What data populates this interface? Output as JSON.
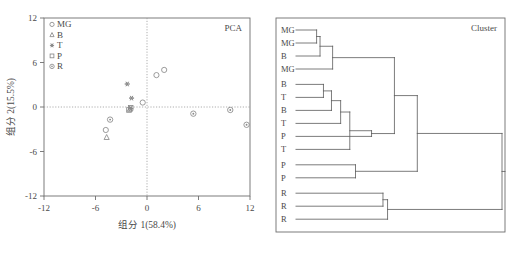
{
  "figure": {
    "width": 513,
    "height": 274,
    "background": "#ffffff",
    "ink_color": "#4a4a4a"
  },
  "chart_data": [
    {
      "type": "scatter",
      "title": "PCA",
      "xlabel": "组分 1(58.4%)",
      "ylabel": "组分 2(15.5%)",
      "xlim": [
        -12,
        12
      ],
      "ylim": [
        -12,
        12
      ],
      "xticks": [
        -12,
        -6,
        0,
        6,
        12
      ],
      "yticks": [
        -12,
        -6,
        0,
        6,
        12
      ],
      "grid": false,
      "zero_reference_lines": true,
      "legend_position": "top-left",
      "legend": [
        {
          "label": "MG",
          "marker": "open-circle"
        },
        {
          "label": "B",
          "marker": "open-triangle"
        },
        {
          "label": "T",
          "marker": "star"
        },
        {
          "label": "P",
          "marker": "open-square"
        },
        {
          "label": "R",
          "marker": "circle-dot"
        }
      ],
      "series": [
        {
          "name": "MG",
          "marker": "open-circle",
          "points": [
            {
              "x": 1.1,
              "y": 4.3
            },
            {
              "x": 2.0,
              "y": 5.0
            },
            {
              "x": -0.5,
              "y": 0.6
            },
            {
              "x": -4.8,
              "y": -3.1
            }
          ]
        },
        {
          "name": "B",
          "marker": "open-triangle",
          "points": [
            {
              "x": -4.7,
              "y": -4.1
            },
            {
              "x": -2.0,
              "y": -0.3
            }
          ]
        },
        {
          "name": "T",
          "marker": "star",
          "points": [
            {
              "x": -2.3,
              "y": 3.1
            },
            {
              "x": -1.8,
              "y": 1.2
            },
            {
              "x": -1.9,
              "y": -0.2
            }
          ]
        },
        {
          "name": "P",
          "marker": "open-square",
          "points": [
            {
              "x": -1.9,
              "y": -0.1
            },
            {
              "x": -2.1,
              "y": -0.4
            }
          ]
        },
        {
          "name": "R",
          "marker": "circle-dot",
          "points": [
            {
              "x": -4.3,
              "y": -1.7
            },
            {
              "x": 5.4,
              "y": -0.9
            },
            {
              "x": 9.7,
              "y": -0.4
            },
            {
              "x": 11.6,
              "y": -2.4
            }
          ]
        }
      ]
    },
    {
      "type": "dendrogram",
      "title": "Cluster",
      "orientation": "left-to-right",
      "leaf_labels": [
        "MG",
        "MG",
        "B",
        "MG",
        "B",
        "T",
        "B",
        "T",
        "P",
        "T",
        "P",
        "P",
        "R",
        "R",
        "R"
      ],
      "merges": [
        {
          "id": "m1",
          "children": [
            "leaf0",
            "leaf1"
          ],
          "height": 0.09
        },
        {
          "id": "m2",
          "children": [
            "m1",
            "leaf2"
          ],
          "height": 0.105
        },
        {
          "id": "m3",
          "children": [
            "m2",
            "leaf3"
          ],
          "height": 0.16
        },
        {
          "id": "m4",
          "children": [
            "leaf4",
            "leaf5"
          ],
          "height": 0.12
        },
        {
          "id": "m5",
          "children": [
            "m4",
            "leaf6"
          ],
          "height": 0.155
        },
        {
          "id": "m6",
          "children": [
            "m5",
            "leaf7"
          ],
          "height": 0.195
        },
        {
          "id": "m7",
          "children": [
            "m6",
            "leaf9"
          ],
          "height": 0.235
        },
        {
          "id": "m8",
          "children": [
            "m7",
            "leaf8"
          ],
          "height": 0.33
        },
        {
          "id": "m9",
          "children": [
            "m3",
            "m8"
          ],
          "height": 0.43
        },
        {
          "id": "m10",
          "children": [
            "leaf10",
            "leaf11"
          ],
          "height": 0.26
        },
        {
          "id": "m11",
          "children": [
            "m9",
            "m10"
          ],
          "height": 0.53
        },
        {
          "id": "m12",
          "children": [
            "leaf12",
            "leaf13"
          ],
          "height": 0.38
        },
        {
          "id": "m13",
          "children": [
            "m12",
            "leaf14"
          ],
          "height": 0.4
        },
        {
          "id": "m14",
          "children": [
            "m11",
            "m13"
          ],
          "height": 0.9
        }
      ]
    }
  ]
}
